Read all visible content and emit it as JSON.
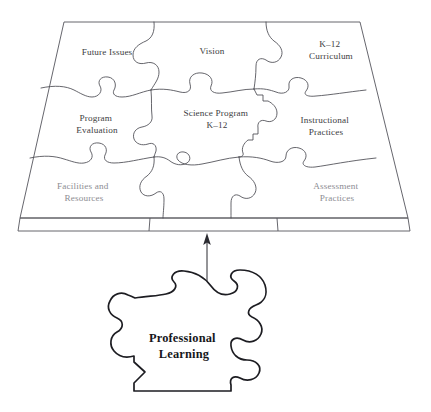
{
  "diagram": {
    "board": {
      "name": "trapezoid-platform",
      "description": "Perspective platform holding eight puzzle pieces"
    },
    "pieces": [
      {
        "id": "future-issues",
        "label": "Future Issues",
        "lines": [
          "Future Issues"
        ],
        "row": 1,
        "col": 1,
        "x": 107,
        "y": 53,
        "style": "normal"
      },
      {
        "id": "vision",
        "label": "Vision",
        "lines": [
          "Vision"
        ],
        "row": 1,
        "col": 2,
        "x": 212,
        "y": 52,
        "style": "normal"
      },
      {
        "id": "k12-curriculum",
        "label": "K–12 Curriculum",
        "lines": [
          "K–12",
          "Curriculum"
        ],
        "row": 1,
        "col": 3,
        "x": 331,
        "y": 50,
        "style": "normal"
      },
      {
        "id": "program-evaluation",
        "label": "Program Evaluation",
        "lines": [
          "Program",
          "Evaluation"
        ],
        "row": 2,
        "col": 1,
        "x": 97,
        "y": 123,
        "style": "normal"
      },
      {
        "id": "science-program-k12",
        "label": "Science Program K–12",
        "lines": [
          "Science Program",
          "K–12"
        ],
        "row": 2,
        "col": 2,
        "x": 217,
        "y": 118,
        "style": "normal"
      },
      {
        "id": "instructional-practices",
        "label": "Instructional Practices",
        "lines": [
          "Instructional",
          "Practices"
        ],
        "row": 2,
        "col": 3,
        "x": 326,
        "y": 125,
        "style": "normal"
      },
      {
        "id": "facilities-and-resources",
        "label": "Facilities and Resources",
        "lines": [
          "Facilities and",
          "Resources"
        ],
        "row": 3,
        "col": 1,
        "x": 84,
        "y": 190,
        "style": "faded"
      },
      {
        "id": "assessment-practices",
        "label": "Assessment Practices",
        "lines": [
          "Assessment",
          "Practices"
        ],
        "row": 3,
        "col": 3,
        "x": 337,
        "y": 190,
        "style": "faded"
      }
    ],
    "bottom_piece": {
      "id": "professional-learning",
      "label": "Professional Learning",
      "lines": [
        "Professional",
        "Learning"
      ],
      "x": 215,
      "y": 345
    },
    "arrow": {
      "name": "upward-arrow",
      "from_label": "Professional Learning",
      "to_label": "Science Program K–12",
      "direction": "up"
    },
    "colors": {
      "background": "#ffffff",
      "line": "#4a4a52",
      "board_edge": "#55555c",
      "label_text": "#3d3d42",
      "label_text_faded": "#8d8d93",
      "bold_text": "#17171b",
      "arrow": "#2b2b31"
    }
  }
}
